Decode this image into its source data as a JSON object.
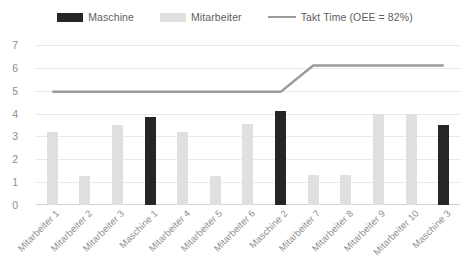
{
  "legend": {
    "items": [
      {
        "label": "Maschine",
        "type": "swatch",
        "color": "#262626",
        "icon": "bar-swatch-icon"
      },
      {
        "label": "Mitarbeiter",
        "type": "swatch",
        "color": "#e0e0e0",
        "icon": "bar-swatch-icon"
      },
      {
        "label": "Takt Time (OEE = 82%)",
        "type": "line",
        "color": "#9a9a9a",
        "icon": "line-swatch-icon"
      }
    ]
  },
  "chart_data": {
    "type": "bar",
    "title": "",
    "xlabel": "",
    "ylabel": "",
    "ylim": [
      0,
      7
    ],
    "yticks": [
      0,
      1,
      2,
      3,
      4,
      5,
      6,
      7
    ],
    "grid": true,
    "legend_position": "top-center",
    "categories": [
      "Mitarbeiter 1",
      "Mitarbeiter 2",
      "Mitarbeiter 3",
      "Maschine 1",
      "Mitarbeiter 4",
      "Mitarbeiter 5",
      "Mitarbeiter 6",
      "Maschine 2",
      "Mitarbeiter 7",
      "Mitarbeiter 8",
      "Mitarbeiter 9",
      "Mitarbeiter 10",
      "Maschine 3"
    ],
    "series": [
      {
        "name": "Maschine",
        "color": "#262626",
        "values": [
          null,
          null,
          null,
          3.85,
          null,
          null,
          null,
          4.1,
          null,
          null,
          null,
          null,
          3.5
        ]
      },
      {
        "name": "Mitarbeiter",
        "color": "#e0e0e0",
        "values": [
          3.2,
          1.25,
          3.5,
          null,
          3.2,
          1.25,
          3.55,
          null,
          1.3,
          1.3,
          4.0,
          4.0,
          null
        ]
      },
      {
        "name": "Takt Time (OEE = 82%)",
        "type": "line",
        "color": "#9a9a9a",
        "values": [
          4.95,
          4.95,
          4.95,
          4.95,
          4.95,
          4.95,
          4.95,
          4.95,
          6.1,
          6.1,
          6.1,
          6.1,
          6.1
        ]
      }
    ],
    "bar_types": [
      "mitarbeiter",
      "mitarbeiter",
      "mitarbeiter",
      "maschine",
      "mitarbeiter",
      "mitarbeiter",
      "mitarbeiter",
      "maschine",
      "mitarbeiter",
      "mitarbeiter",
      "mitarbeiter",
      "mitarbeiter",
      "maschine"
    ],
    "bar_values": [
      3.2,
      1.25,
      3.5,
      3.85,
      3.2,
      1.25,
      3.55,
      4.1,
      1.3,
      1.3,
      4.0,
      4.0,
      3.5
    ]
  },
  "colors": {
    "maschine": "#262626",
    "mitarbeiter": "#e0e0e0",
    "takt_line": "#9a9a9a",
    "gridline": "#e9e9e9",
    "axis_text": "#8d8d8d",
    "background": "#ffffff"
  }
}
